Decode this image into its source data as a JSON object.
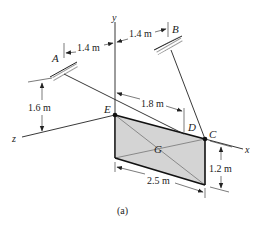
{
  "figure": {
    "caption": "(a)",
    "colors": {
      "ink": "#222222",
      "plate_fill": "#d4d4d4",
      "background": "#ffffff"
    },
    "axes": {
      "x": "x",
      "y": "y",
      "z": "z"
    },
    "points": {
      "A": "A",
      "B": "B",
      "C": "C",
      "D": "D",
      "E": "E",
      "G": "G"
    },
    "dimensions": {
      "a_offset": "1.4 m",
      "b_offset": "1.4 m",
      "a_height": "1.6 m",
      "d_distance": "1.8 m",
      "plate_length": "2.5 m",
      "plate_height": "1.2 m"
    }
  }
}
